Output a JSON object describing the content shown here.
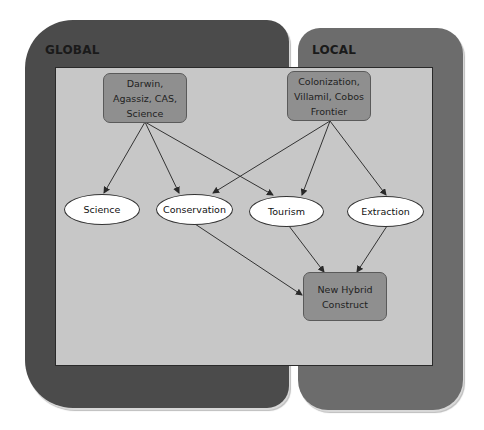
{
  "panels": {
    "global": {
      "title": "GLOBAL",
      "color": "#4b4b4b"
    },
    "local": {
      "title": "LOCAL",
      "color": "#6c6c6c"
    },
    "inner_color": "#c7c7c7"
  },
  "nodes": {
    "darwin": {
      "label": "Darwin,\nAgassiz, CAS,\nScience",
      "shape": "rounded-rect",
      "color": "#8f8f8f"
    },
    "colonization": {
      "label": "Colonization,\nVillamil, Cobos\nFrontier",
      "shape": "rounded-rect",
      "color": "#8f8f8f"
    },
    "science": {
      "label": "Science",
      "shape": "ellipse"
    },
    "conservation": {
      "label": "Conservation",
      "shape": "ellipse"
    },
    "tourism": {
      "label": "Tourism",
      "shape": "ellipse"
    },
    "extraction": {
      "label": "Extraction",
      "shape": "ellipse"
    },
    "hybrid": {
      "label": "New Hybrid\nConstruct",
      "shape": "rounded-rect",
      "color": "#8f8f8f"
    }
  },
  "edges": [
    {
      "from": "darwin",
      "to": "science"
    },
    {
      "from": "darwin",
      "to": "conservation"
    },
    {
      "from": "darwin",
      "to": "tourism"
    },
    {
      "from": "colonization",
      "to": "conservation"
    },
    {
      "from": "colonization",
      "to": "tourism"
    },
    {
      "from": "colonization",
      "to": "extraction"
    },
    {
      "from": "conservation",
      "to": "hybrid"
    },
    {
      "from": "tourism",
      "to": "hybrid"
    },
    {
      "from": "extraction",
      "to": "hybrid"
    }
  ]
}
